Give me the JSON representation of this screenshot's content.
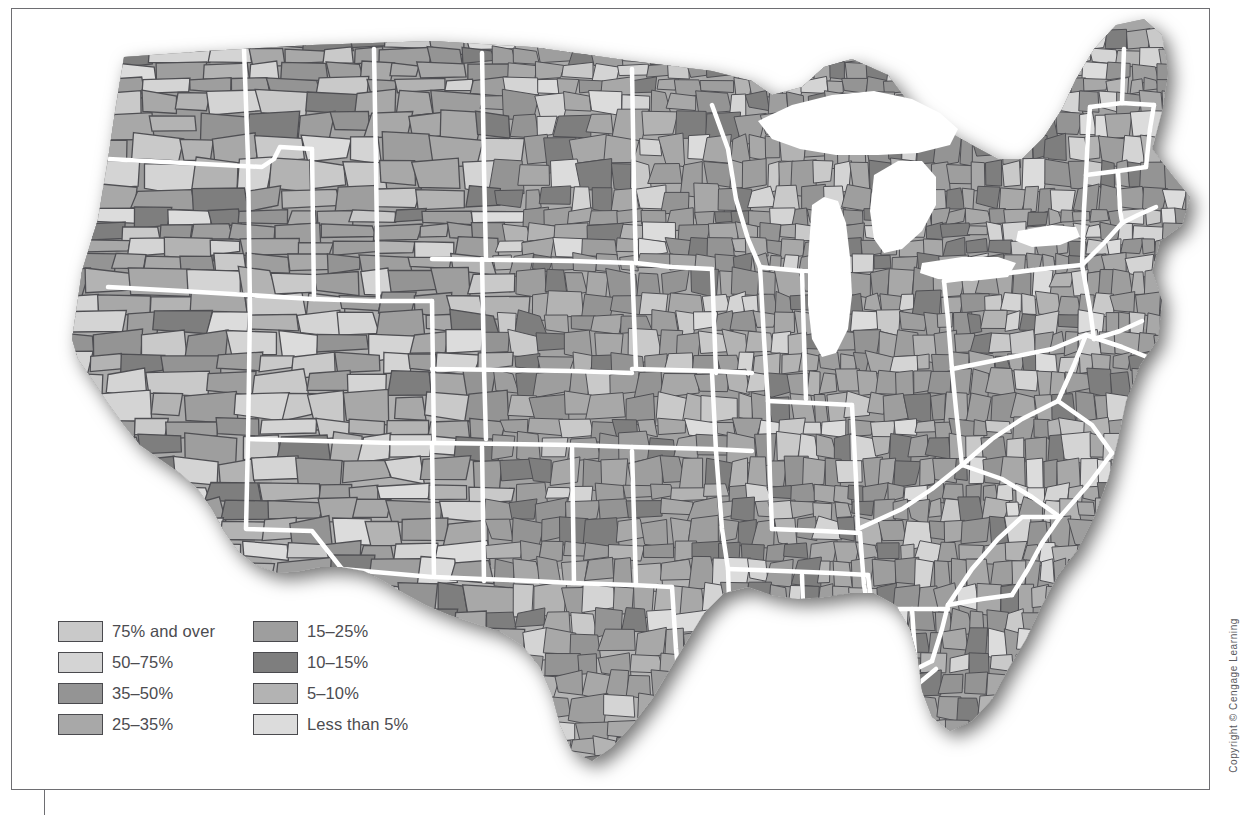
{
  "figure": {
    "type": "choropleth-map",
    "region": "Contiguous United States",
    "unit": "county",
    "shading": "grayscale"
  },
  "legend": {
    "columns": [
      {
        "items": [
          {
            "label": "75% and over",
            "color": "#c9c9c9"
          },
          {
            "label": "50–75%",
            "color": "#d4d4d4"
          },
          {
            "label": "35–50%",
            "color": "#949494"
          },
          {
            "label": "25–35%",
            "color": "#a8a8a8"
          }
        ]
      },
      {
        "items": [
          {
            "label": "15–25%",
            "color": "#9e9e9e"
          },
          {
            "label": "10–15%",
            "color": "#7e7e7e"
          },
          {
            "label": "5–10%",
            "color": "#b3b3b3"
          },
          {
            "label": "Less than 5%",
            "color": "#dcdcdc"
          }
        ]
      }
    ]
  },
  "copyright": {
    "text": "Copyright © Cengage Learning"
  },
  "chart_data": {
    "type": "map",
    "title": "",
    "map_type": "county-level choropleth of the contiguous United States",
    "color_scale": "grayscale, 8 classes",
    "legend_entries": [
      {
        "class": "75% and over",
        "color": "#c9c9c9"
      },
      {
        "class": "50–75%",
        "color": "#d4d4d4"
      },
      {
        "class": "35–50%",
        "color": "#949494"
      },
      {
        "class": "25–35%",
        "color": "#a8a8a8"
      },
      {
        "class": "15–25%",
        "color": "#9e9e9e"
      },
      {
        "class": "10–15%",
        "color": "#7e7e7e"
      },
      {
        "class": "5–10%",
        "color": "#b3b3b3"
      },
      {
        "class": "Less than 5%",
        "color": "#dcdcdc"
      }
    ],
    "state_boundaries": "white",
    "county_boundaries": "dark gray",
    "background": "white"
  }
}
